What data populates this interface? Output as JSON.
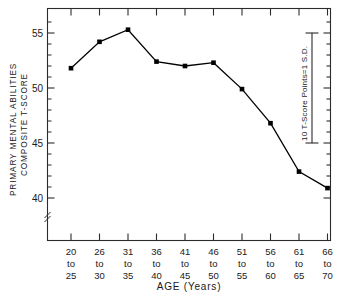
{
  "chart_data": {
    "type": "line",
    "title": "",
    "xlabel": "AGE  (Years)",
    "ylabel_line1": "PRIMARY MENTAL ABILITIES",
    "ylabel_line2": "COMPOSITE T-SCORE",
    "categories": [
      "20\nto\n25",
      "26\nto\n30",
      "31\nto\n35",
      "36\nto\n40",
      "41\nto\n45",
      "46\nto\n50",
      "51\nto\n55",
      "56\nto\n60",
      "61\nto\n65",
      "66\nto\n70"
    ],
    "category_parts": [
      {
        "start": "20",
        "mid": "to",
        "end": "25"
      },
      {
        "start": "26",
        "mid": "to",
        "end": "30"
      },
      {
        "start": "31",
        "mid": "to",
        "end": "35"
      },
      {
        "start": "36",
        "mid": "to",
        "end": "40"
      },
      {
        "start": "41",
        "mid": "to",
        "end": "45"
      },
      {
        "start": "46",
        "mid": "to",
        "end": "50"
      },
      {
        "start": "51",
        "mid": "to",
        "end": "55"
      },
      {
        "start": "56",
        "mid": "to",
        "end": "60"
      },
      {
        "start": "61",
        "mid": "to",
        "end": "65"
      },
      {
        "start": "66",
        "mid": "to",
        "end": "70"
      }
    ],
    "values": [
      51.8,
      54.2,
      55.3,
      52.4,
      52.0,
      52.3,
      49.9,
      46.8,
      42.4,
      40.9
    ],
    "ytick_labels": [
      "40",
      "45",
      "50",
      "55"
    ],
    "ytick_values": [
      40,
      45,
      50,
      55
    ],
    "yminor_step": 1,
    "ylim": [
      38.2,
      56.6
    ],
    "axis_break": true,
    "grid": false,
    "legend": "none",
    "marker": "filled-square",
    "line_color": "#000000",
    "marker_color": "#000000",
    "axis_color": "#2b2b2b",
    "background": "#ffffff",
    "annotation": {
      "text": "10 T-Score Points=1 S.D.",
      "span_units": 10,
      "span_from": 45,
      "span_to": 55
    }
  }
}
